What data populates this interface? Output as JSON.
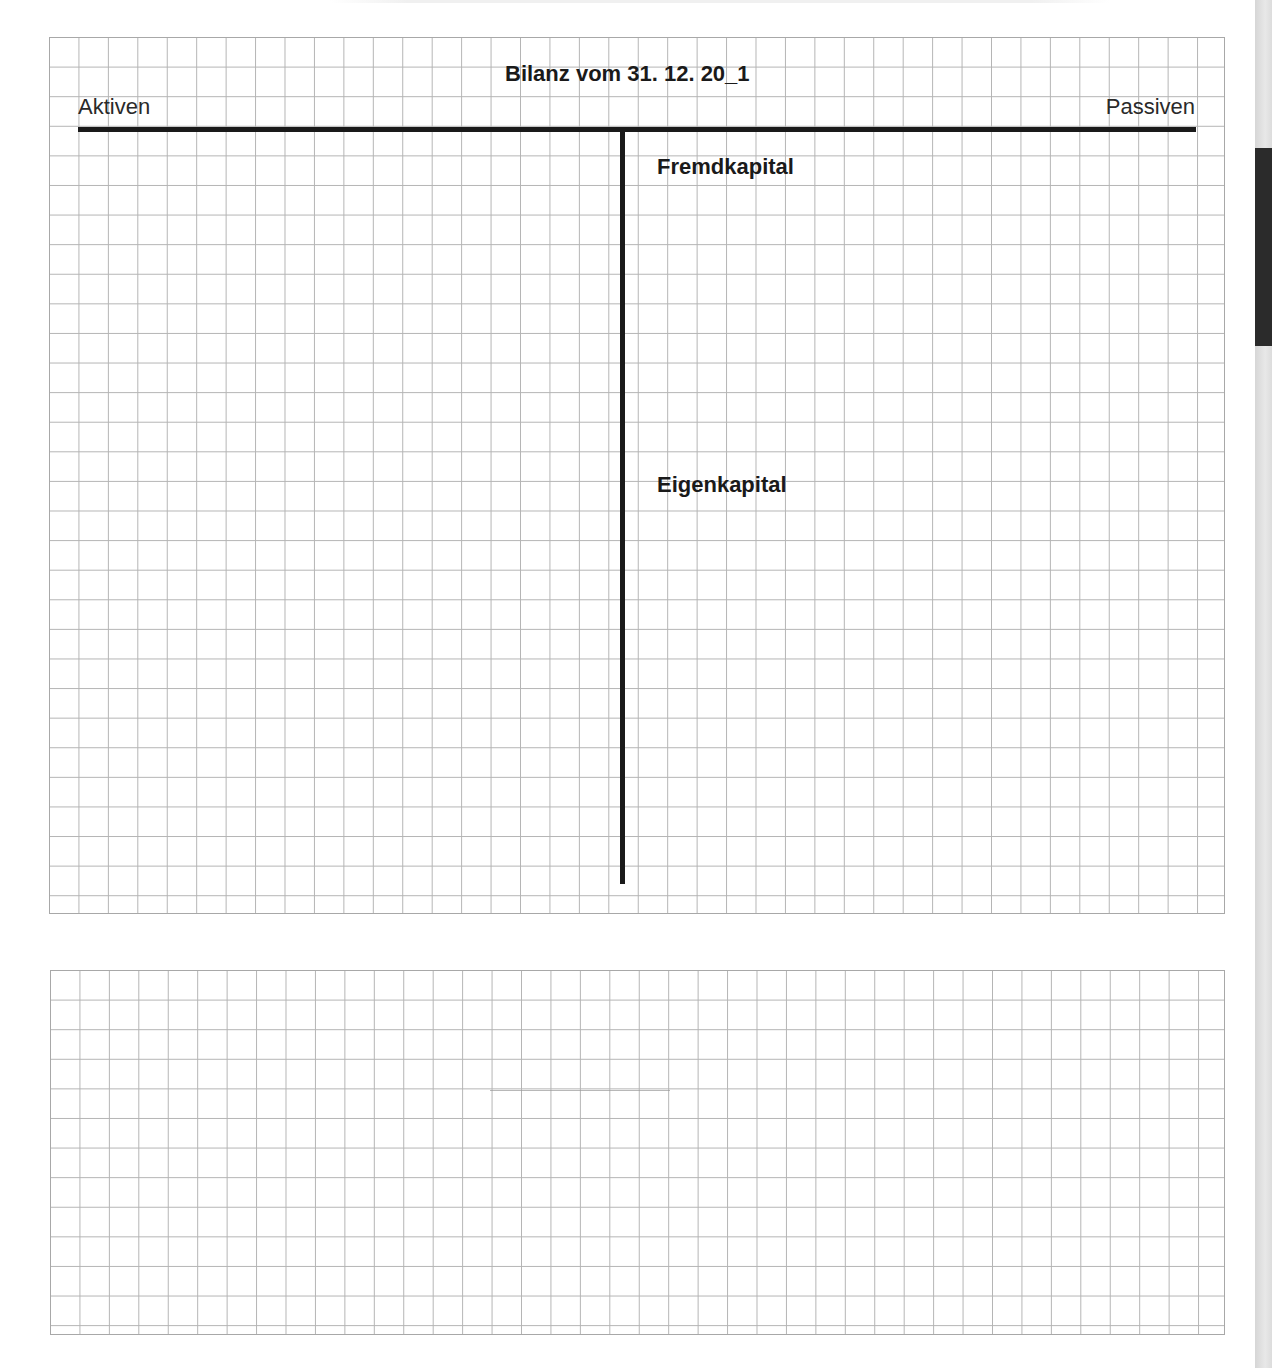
{
  "document": {
    "balance_sheet": {
      "title": "Bilanz vom 31. 12. 20_1",
      "left_side_label": "Aktiven",
      "right_side_label": "Passiven",
      "sections": {
        "liabilities": "Fremdkapital",
        "equity": "Eigenkapital"
      }
    },
    "page_edge": {
      "tab_color": "#2b2b2b",
      "edge_color": "#dcdcdc"
    },
    "colors": {
      "ink": "#1a1a1a",
      "grid_line": "#b4b4b4",
      "paper": "#ffffff"
    }
  }
}
